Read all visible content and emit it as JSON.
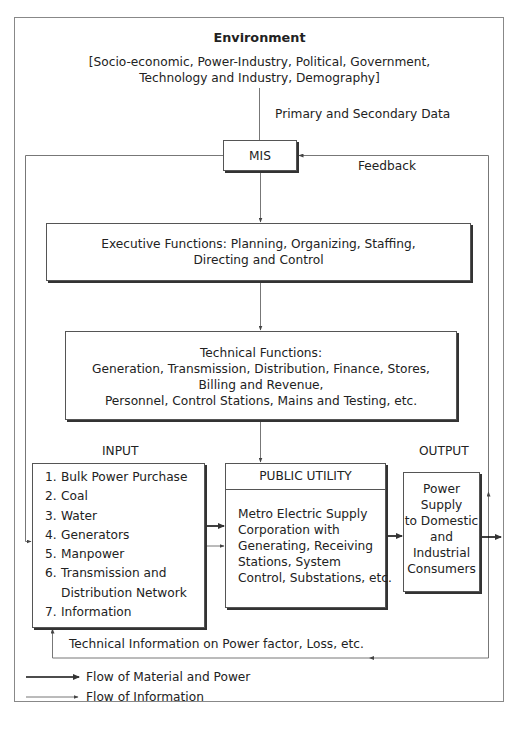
{
  "environment": {
    "title": "Environment",
    "factors_line1": "[Socio-economic, Power-Industry, Political, Government,",
    "factors_line2": "Technology and Industry, Demography]"
  },
  "data_label": "Primary and Secondary Data",
  "mis": {
    "label": "MIS"
  },
  "feedback_label": "Feedback",
  "executive": {
    "line1": "Executive Functions: Planning, Organizing, Staffing,",
    "line2": "Directing and Control"
  },
  "technical": {
    "line1": "Technical Functions:",
    "line2": "Generation, Transmission, Distribution, Finance, Stores,",
    "line3": "Billing and Revenue,",
    "line4": "Personnel, Control Stations, Mains and Testing, etc."
  },
  "input": {
    "label": "INPUT",
    "items": [
      {
        "num": "1.",
        "text": "Bulk Power Purchase"
      },
      {
        "num": "2.",
        "text": "Coal"
      },
      {
        "num": "3.",
        "text": "Water"
      },
      {
        "num": "4.",
        "text": "Generators"
      },
      {
        "num": "5.",
        "text": "Manpower"
      },
      {
        "num": "6.",
        "text": "Transmission and"
      },
      {
        "num": "",
        "text": "Distribution Network"
      },
      {
        "num": "7.",
        "text": "Information"
      }
    ]
  },
  "public_utility": {
    "title": "PUBLIC UTILITY",
    "line1": "Metro Electric Supply",
    "line2": "Corporation with",
    "line3": "Generating, Receiving",
    "line4": "Stations, System",
    "line5": "Control, Substations, etc."
  },
  "output": {
    "label": "OUTPUT",
    "line1": "Power",
    "line2": "Supply",
    "line3": "to Domestic",
    "line4": "and",
    "line5": "Industrial",
    "line6": "Consumers"
  },
  "technical_info_label": "Technical Information on Power factor, Loss, etc.",
  "legend": {
    "material": "Flow of Material and Power",
    "information": "Flow of Information"
  },
  "colors": {
    "frame": "#888888",
    "box_border": "#555555",
    "thick_arrow": "#111111",
    "thin_line": "#777777"
  }
}
